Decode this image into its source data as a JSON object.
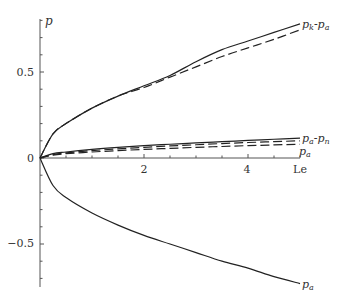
{
  "chart_data": {
    "type": "line",
    "title": "",
    "xlabel": "Le",
    "ylabel": "p",
    "xlim": [
      0,
      5
    ],
    "ylim": [
      -0.75,
      0.8
    ],
    "x_ticks": [
      2,
      4
    ],
    "x_tick_labels": [
      "2",
      "4"
    ],
    "y_ticks": [
      0.5,
      0,
      -0.5
    ],
    "y_tick_labels": [
      "0.5",
      "0",
      "-0.5"
    ],
    "grid": false,
    "legend": "inline labels at line ends",
    "x": [
      0,
      0.25,
      0.5,
      1,
      1.5,
      2,
      2.5,
      3,
      3.5,
      4,
      4.5,
      5
    ],
    "series": [
      {
        "name": "p_k - p_a (solid)",
        "style": "solid",
        "label": "p_k-p_a",
        "values": [
          0,
          0.14,
          0.2,
          0.29,
          0.36,
          0.42,
          0.48,
          0.56,
          0.63,
          0.68,
          0.73,
          0.78
        ]
      },
      {
        "name": "p_k - p_a (dashed)",
        "style": "dashed",
        "label": "",
        "values": [
          0,
          0.14,
          0.2,
          0.29,
          0.36,
          0.41,
          0.47,
          0.53,
          0.59,
          0.64,
          0.69,
          0.745
        ]
      },
      {
        "name": "p_a - p_n (solid)",
        "style": "solid",
        "label": "p_a-p_n",
        "values": [
          0,
          0.025,
          0.035,
          0.05,
          0.062,
          0.072,
          0.08,
          0.088,
          0.095,
          0.102,
          0.109,
          0.116
        ]
      },
      {
        "name": "p_a - p_n (dashed)",
        "style": "dashed",
        "label": "",
        "values": [
          0,
          0.02,
          0.03,
          0.043,
          0.053,
          0.062,
          0.07,
          0.077,
          0.084,
          0.09,
          0.095,
          0.1
        ]
      },
      {
        "name": "p_a (dashed)",
        "style": "dashed",
        "label": "p_a",
        "values": [
          0,
          0.017,
          0.025,
          0.035,
          0.043,
          0.05,
          0.056,
          0.062,
          0.067,
          0.072,
          0.076,
          0.08
        ]
      },
      {
        "name": "p_a (lower, solid)",
        "style": "solid",
        "label": "p_a",
        "values": [
          0,
          -0.16,
          -0.23,
          -0.32,
          -0.39,
          -0.45,
          -0.5,
          -0.55,
          -0.6,
          -0.64,
          -0.69,
          -0.73
        ]
      }
    ]
  },
  "labels": {
    "y_axis": "p",
    "x_axis": "Le",
    "top_curve": "p_k-p_a",
    "mid_curve_1": "p_a-p_n",
    "mid_curve_2": "p_a",
    "bottom_curve": "p_a",
    "tick_05": "0.5",
    "tick_0": "0",
    "tick_m05": "−0.5",
    "tick_2": "2",
    "tick_4": "4"
  }
}
